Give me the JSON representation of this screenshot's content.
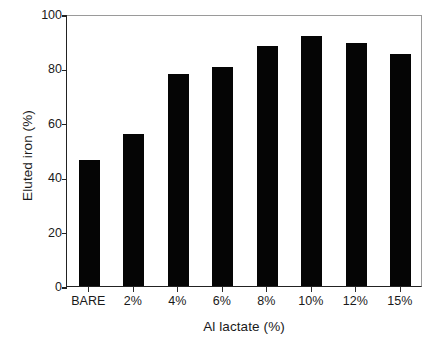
{
  "chart_data": {
    "type": "bar",
    "title": "",
    "xlabel": "Al lactate (%)",
    "ylabel": "Eluted iron (%)",
    "categories": [
      "BARE",
      "2%",
      "4%",
      "6%",
      "8%",
      "10%",
      "12%",
      "15%"
    ],
    "values": [
      46.5,
      55.8,
      78.0,
      80.6,
      88.2,
      92.0,
      89.2,
      85.3
    ],
    "ylim": [
      0,
      100
    ],
    "yticks": [
      0,
      20,
      40,
      60,
      80,
      100
    ],
    "ytick_labels": [
      "0",
      "20",
      "40",
      "60",
      "80",
      "100"
    ],
    "grid": false,
    "legend": false,
    "legend_position": "none",
    "bar_color": "#050505",
    "axis_color": "#222222",
    "frame_color": "#9a9a9a",
    "background_color": "#ffffff"
  }
}
